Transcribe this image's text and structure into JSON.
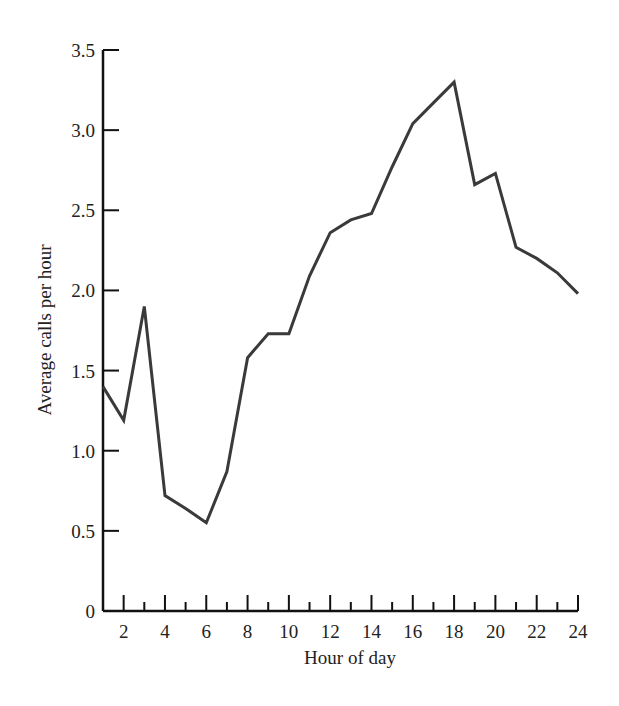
{
  "chart_data": {
    "type": "line",
    "title": "",
    "xlabel": "Hour of day",
    "ylabel": "Average calls per hour",
    "x": [
      1,
      2,
      3,
      4,
      5,
      6,
      7,
      8,
      9,
      10,
      11,
      12,
      13,
      14,
      15,
      16,
      17,
      18,
      19,
      20,
      21,
      22,
      23,
      24
    ],
    "values": [
      1.4,
      1.19,
      1.9,
      0.72,
      0.64,
      0.55,
      0.87,
      1.58,
      1.73,
      1.73,
      2.09,
      2.36,
      2.44,
      2.48,
      2.77,
      3.04,
      3.17,
      3.3,
      2.66,
      2.73,
      2.27,
      2.2,
      2.11,
      1.98
    ],
    "xlim": [
      1,
      24
    ],
    "ylim": [
      0,
      3.5
    ],
    "x_tick_labels": [
      "2",
      "4",
      "6",
      "8",
      "10",
      "12",
      "14",
      "16",
      "18",
      "20",
      "22",
      "24"
    ],
    "x_tick_values": [
      2,
      4,
      6,
      8,
      10,
      12,
      14,
      16,
      18,
      20,
      22,
      24
    ],
    "x_minor_ticks": [
      3,
      5,
      7,
      9,
      11,
      13,
      15,
      17,
      19,
      21,
      23
    ],
    "y_tick_labels": [
      "0",
      "0.5",
      "1.0",
      "1.5",
      "2.0",
      "2.5",
      "3.0",
      "3.5"
    ],
    "y_tick_values": [
      0,
      0.5,
      1.0,
      1.5,
      2.0,
      2.5,
      3.0,
      3.5
    ],
    "grid": false,
    "legend": null,
    "line_color": "#3a3a3a",
    "axis_color": "#111111"
  }
}
